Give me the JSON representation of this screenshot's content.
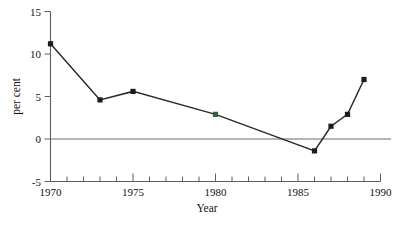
{
  "chart_data": {
    "type": "line",
    "title": "",
    "xlabel": "Year",
    "ylabel": "per cent",
    "xlim": [
      1970,
      1990
    ],
    "ylim": [
      -5,
      15
    ],
    "grid": false,
    "legend": null,
    "x_major_ticks": [
      1970,
      1975,
      1980,
      1985,
      1990
    ],
    "x_major_tick_labels": [
      "1970",
      "1975",
      "1980",
      "1985",
      "1990"
    ],
    "x_minor_tick_step": 1,
    "y_ticks": [
      -5,
      0,
      5,
      10,
      15
    ],
    "y_tick_labels": [
      "-5",
      "0",
      "5",
      "10",
      "15"
    ],
    "zero_reference_line": 0,
    "marker": "square",
    "series": [
      {
        "name": "per cent",
        "x": [
          1970,
          1973,
          1975,
          1980,
          1986,
          1987,
          1988,
          1989
        ],
        "values": [
          11.2,
          4.6,
          5.6,
          2.9,
          -1.4,
          1.5,
          2.9,
          7.0
        ]
      }
    ]
  },
  "colors": {
    "background": "#ffffff",
    "line": "#2b2b2b",
    "marker": "#1c1c1c",
    "marker_tinted": "#3f5c3f",
    "axis": "#5e5e5e",
    "zero_line": "#6b6b6b",
    "text": "#111111"
  },
  "labels": {
    "y_15": "15",
    "y_10": "10",
    "y_5": "5",
    "y_0": "0",
    "y_neg5": "-5",
    "x_1970": "1970",
    "x_1975": "1975",
    "x_1980": "1980",
    "x_1985": "1985",
    "x_1990": "1990",
    "axis_x_title": "Year",
    "axis_y_title": "per cent"
  }
}
